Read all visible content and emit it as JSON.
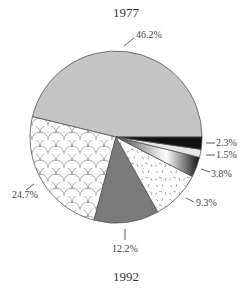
{
  "titles": {
    "top": "1977",
    "bottom": "1992"
  },
  "chart_data": {
    "type": "pie",
    "title": "1977",
    "subtitle_next_chart": "1992",
    "slices": [
      {
        "label": "46.2%",
        "value": 46.2,
        "fill": "gray"
      },
      {
        "label": "24.7%",
        "value": 24.7,
        "fill": "scallop-pattern"
      },
      {
        "label": "12.2%",
        "value": 12.2,
        "fill": "dark-gray"
      },
      {
        "label": "9.3%",
        "value": 9.3,
        "fill": "speckled-white"
      },
      {
        "label": "3.8%",
        "value": 3.8,
        "fill": "gradient-black-white"
      },
      {
        "label": "1.5%",
        "value": 1.5,
        "fill": "light-gray"
      },
      {
        "label": "2.3%",
        "value": 2.3,
        "fill": "black"
      }
    ],
    "start_angle_deg": 0,
    "direction": "counterclockwise-from-east",
    "legend": "none"
  },
  "labels": {
    "s46": "46.2%",
    "s24": "24.7%",
    "s12": "12.2%",
    "s9": "9.3%",
    "s3_8": "3.8%",
    "s1_5": "1.5%",
    "s2_3": "2.3%"
  },
  "colors": {
    "gray": "#c4c4c4",
    "dark_gray": "#7a7a7a",
    "black": "#111111",
    "light": "#e6e6e6",
    "outline": "#555555"
  }
}
